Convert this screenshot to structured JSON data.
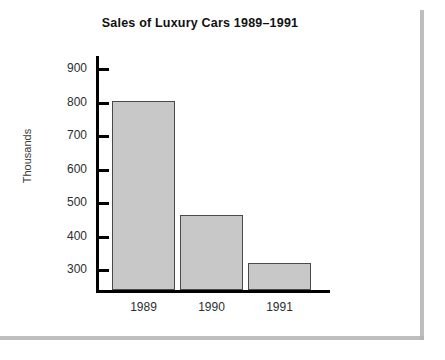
{
  "chart_data": {
    "type": "bar",
    "title": "Sales of Luxury Cars 1989–1991",
    "xlabel": "",
    "ylabel": "Thousands",
    "categories": [
      "1989",
      "1990",
      "1991"
    ],
    "values": [
      805,
      465,
      322
    ],
    "ylim": [
      240,
      940
    ],
    "yticks": [
      300,
      400,
      500,
      600,
      700,
      800,
      900
    ],
    "ytick_labels": [
      "300",
      "400",
      "500",
      "600",
      "700",
      "800",
      "900"
    ],
    "grid": false,
    "legend": null,
    "bar_color": "#c8c8c8",
    "bar_edge_color": "#4a4a4a",
    "axis_color": "#000000",
    "title_color": "#111111",
    "tick_text_color": "#2e2e2e"
  },
  "page": {
    "background": "#ffffff",
    "edge_shadow_color": "#b3b3b3"
  }
}
